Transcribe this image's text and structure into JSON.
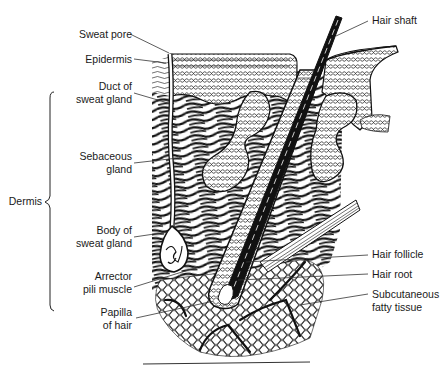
{
  "diagram": {
    "colors": {
      "ink": "#111111",
      "background": "#ffffff",
      "leader": "#333333"
    },
    "labels_left": [
      {
        "id": "sweat-pore",
        "lines": [
          "Sweat pore"
        ]
      },
      {
        "id": "epidermis",
        "lines": [
          "Epidermis"
        ]
      },
      {
        "id": "duct-of-sweat-gland",
        "lines": [
          "Duct of",
          "sweat gland"
        ]
      },
      {
        "id": "sebaceous-gland",
        "lines": [
          "Sebaceous",
          "gland"
        ]
      },
      {
        "id": "body-of-sweat-gland",
        "lines": [
          "Body of",
          "sweat gland"
        ]
      },
      {
        "id": "arrector-pili-muscle",
        "lines": [
          "Arrector",
          "pili muscle"
        ]
      },
      {
        "id": "papilla-of-hair",
        "lines": [
          "Papilla",
          "of hair"
        ]
      }
    ],
    "labels_right": [
      {
        "id": "hair-shaft",
        "lines": [
          "Hair shaft"
        ]
      },
      {
        "id": "hair-follicle",
        "lines": [
          "Hair follicle"
        ]
      },
      {
        "id": "hair-root",
        "lines": [
          "Hair root"
        ]
      },
      {
        "id": "subcutaneous-fatty-tissue",
        "lines": [
          "Subcutaneous",
          "fatty tissue"
        ]
      }
    ],
    "bracket_label": "Dermis"
  }
}
